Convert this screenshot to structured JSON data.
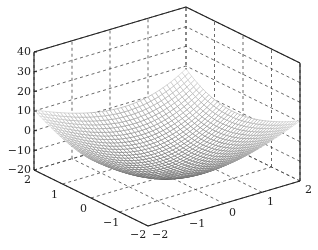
{
  "chart_data": {
    "type": "surface-mesh",
    "title": "",
    "xlabel": "",
    "ylabel": "",
    "zlabel": "",
    "xlim": [
      -2,
      2
    ],
    "ylim": [
      -2,
      2
    ],
    "zlim": [
      -20,
      40
    ],
    "x_ticks": [
      "-2",
      "-1",
      "0",
      "1",
      "2"
    ],
    "y_ticks": [
      "-2",
      "-1",
      "0",
      "1",
      "2"
    ],
    "z_ticks": [
      "40",
      "30",
      "20",
      "10",
      "0",
      "-10",
      "-20"
    ],
    "grid": true,
    "grid_style": "dashed",
    "box": true,
    "colormap": "gray",
    "surface_description": "Wireframe mesh over x,y in [-2,2]; peak cusp ~15 near (-2,-2), troughs ~-20 near (-2,1) and (1,-2), rising to ~10-15 toward (2,2)",
    "sample_points": [
      {
        "x": -2,
        "y": -2,
        "z": 15
      },
      {
        "x": -2,
        "y": 1,
        "z": -20
      },
      {
        "x": 1,
        "y": -2,
        "z": -20
      },
      {
        "x": 2,
        "y": 2,
        "z": 12
      },
      {
        "x": -2,
        "y": 2,
        "z": 5
      },
      {
        "x": 2,
        "y": -2,
        "z": 10
      }
    ]
  },
  "labels": {
    "z": [
      "40",
      "30",
      "20",
      "10",
      "0",
      "−10",
      "−20"
    ],
    "y": [
      "2",
      "1",
      "0",
      "−1",
      "−2"
    ],
    "x": [
      "−2",
      "−1",
      "0",
      "1",
      "2"
    ]
  }
}
